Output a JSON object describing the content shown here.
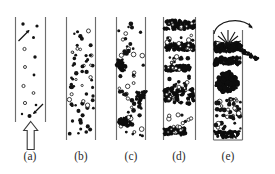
{
  "figure": {
    "background_color": "#ffffff",
    "ink_color": "#131313",
    "wall_color": "#6d6d6d",
    "width": 275,
    "height": 174
  },
  "panels": [
    {
      "id": "a",
      "label": "(a)",
      "regime": "bubbly flow",
      "label_x": 24,
      "label_y": 150,
      "tube": {
        "x": 15,
        "y": 17,
        "width": 31,
        "height": 105
      },
      "bubble_density": "sparse",
      "annotations": {
        "inlet_arrow": {
          "type": "hollow-up-arrow",
          "x": 24,
          "y": 122,
          "width": 14,
          "height": 28
        },
        "pointer_arrows": 2
      },
      "bubbles": [
        {
          "x": 23,
          "y": 24,
          "r": 1.6,
          "open": false
        },
        {
          "x": 37,
          "y": 26,
          "r": 1.5,
          "open": false
        },
        {
          "x": 32,
          "y": 37,
          "r": 1.4,
          "open": false
        },
        {
          "x": 24,
          "y": 48,
          "r": 1.5,
          "open": true
        },
        {
          "x": 35,
          "y": 56,
          "r": 1.6,
          "open": false
        },
        {
          "x": 25,
          "y": 66,
          "r": 1.4,
          "open": true
        },
        {
          "x": 34,
          "y": 74,
          "r": 1.3,
          "open": false
        },
        {
          "x": 23,
          "y": 85,
          "r": 1.5,
          "open": true
        },
        {
          "x": 33,
          "y": 92,
          "r": 1.3,
          "open": true
        },
        {
          "x": 25,
          "y": 102,
          "r": 1.5,
          "open": true
        },
        {
          "x": 36,
          "y": 104,
          "r": 1.3,
          "open": false
        },
        {
          "x": 29,
          "y": 115,
          "r": 1.8,
          "open": false
        },
        {
          "x": 22,
          "y": 113,
          "r": 1.2,
          "open": false
        }
      ]
    },
    {
      "id": "b",
      "label": "(b)",
      "regime": "dispersed bubbly flow",
      "label_x": 74,
      "label_y": 150,
      "tube": {
        "x": 66,
        "y": 17,
        "width": 30,
        "height": 123
      },
      "bubble_density": "uniform dense",
      "annotations": {},
      "bubbles": []
    },
    {
      "id": "c",
      "label": "(c)",
      "regime": "slug / cap bubble flow",
      "label_x": 124,
      "label_y": 150,
      "tube": {
        "x": 116,
        "y": 17,
        "width": 30,
        "height": 123
      },
      "bubble_density": "dense with clusters",
      "annotations": {
        "clusters": 3
      },
      "bubbles": []
    },
    {
      "id": "d",
      "label": "(d)",
      "regime": "churn flow",
      "label_x": 171,
      "label_y": 150,
      "tube": {
        "x": 163,
        "y": 17,
        "width": 33,
        "height": 123
      },
      "bubble_density": "banded slugs",
      "annotations": {
        "bands": 4
      },
      "bubbles": []
    },
    {
      "id": "e",
      "label": "(e)",
      "regime": "annular / spray flow",
      "label_x": 220,
      "label_y": 150,
      "tube": {
        "x": 213,
        "y": 27,
        "width": 30,
        "height": 113
      },
      "bubble_density": "churning with ejection",
      "annotations": {
        "burst": {
          "type": "starburst",
          "x": 228,
          "y": 30
        },
        "curved_arrow": {
          "type": "arc-arrow",
          "from_x": 215,
          "from_y": 32,
          "to_x": 256,
          "to_y": 47
        }
      },
      "bubbles": []
    }
  ]
}
